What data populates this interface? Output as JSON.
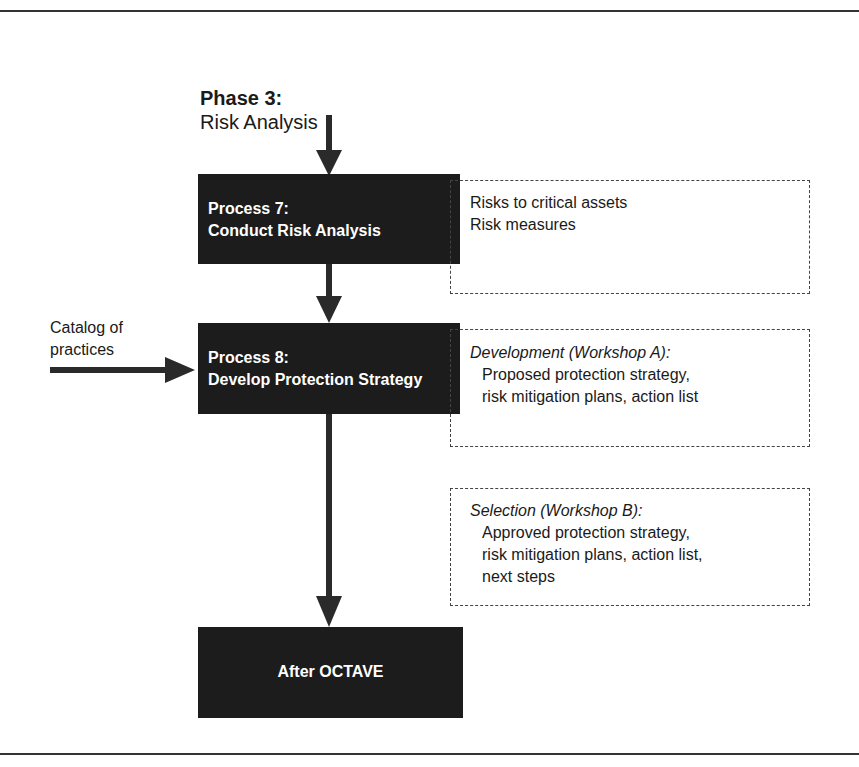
{
  "phase": {
    "title": "Phase 3:",
    "subtitle": "Risk Analysis"
  },
  "process7": {
    "line1": "Process 7:",
    "line2": "Conduct Risk Analysis"
  },
  "process8": {
    "line1": "Process 8:",
    "line2": "Develop Protection Strategy"
  },
  "after": {
    "label": "After OCTAVE"
  },
  "input": {
    "line1": "Catalog of",
    "line2": "practices"
  },
  "outputs7": {
    "line1": "Risks to critical assets",
    "line2": "Risk measures"
  },
  "outputsA": {
    "heading": "Development (Workshop A):",
    "line1": "Proposed protection strategy,",
    "line2": "risk mitigation plans, action list"
  },
  "outputsB": {
    "heading": "Selection (Workshop B):",
    "line1": "Approved protection strategy,",
    "line2": "risk mitigation plans, action list,",
    "line3": "next steps"
  }
}
